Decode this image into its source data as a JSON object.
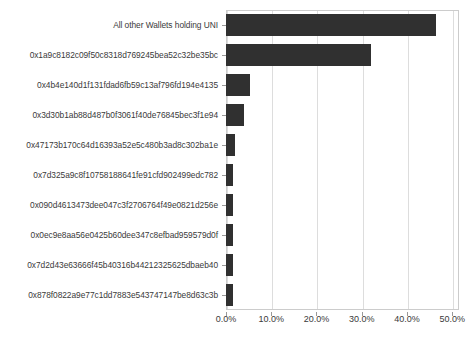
{
  "chart_data": {
    "type": "bar",
    "orientation": "horizontal",
    "title": "",
    "xlabel": "",
    "ylabel": "",
    "xlim": [
      0,
      51.5
    ],
    "xticks": [
      0,
      10,
      20,
      30,
      40,
      50
    ],
    "xtick_labels": [
      "0.0%",
      "10.0%",
      "20.0%",
      "30.0%",
      "40.0%",
      "50.0%"
    ],
    "grid": true,
    "legend": null,
    "bar_color": "#303030",
    "categories": [
      "All other Wallets holding UNI",
      "0x1a9c8182c09f50c8318d769245bea52c32be35bc",
      "0x4b4e140d1f131fdad6fb59c13af796fd194e4135",
      "0x3d30b1ab88d487b0f3061f40de76845bec3f1e94",
      "0x47173b170c64d16393a52e5c480b3ad8c302ba1e",
      "0x7d325a9c8f10758188641fe91cfd902499edc782",
      "0x090d4613473dee047c3f2706764f49e0821d256e",
      "0x0ec9e8aa56e0425b60dee347c8efbad959579d0f",
      "0x7d2d43e63666f45b40316b44212325625dbaeb40",
      "0x878f0822a9e77c1dd7883e543747147be8d63c3b"
    ],
    "values": [
      46.5,
      32.1,
      5.2,
      3.9,
      2.0,
      1.5,
      1.5,
      1.5,
      1.5,
      1.5
    ],
    "value_labels": [
      "46.5%",
      "32.1%",
      "5.2%",
      "3.9%",
      "2.0%",
      "1.5%",
      "1.5%",
      "1.5%",
      "1.5%",
      "1.5%"
    ]
  }
}
